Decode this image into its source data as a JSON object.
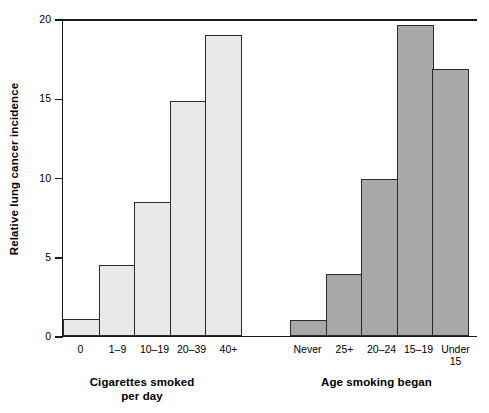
{
  "chart_data": {
    "type": "bar",
    "title": "",
    "xlabel": "",
    "ylabel": "Relative lung cancer incidence",
    "ylim": [
      0,
      20
    ],
    "yticks": [
      0,
      5,
      10,
      15,
      20
    ],
    "ytick_labels": [
      "0",
      "5",
      "10",
      "15",
      "20"
    ],
    "grid": false,
    "legend": "none",
    "groups": [
      {
        "name": "Cigarettes smoked per day",
        "title_lines": [
          "Cigarettes smoked",
          "per day"
        ],
        "color": "#e9e9e9",
        "categories": [
          "0",
          "1–9",
          "10–19",
          "20–39",
          "40+"
        ],
        "values": [
          1.1,
          4.5,
          8.45,
          14.8,
          19.0
        ]
      },
      {
        "name": "Age smoking began",
        "title_lines": [
          "Age smoking began"
        ],
        "color": "#a9a9a9",
        "categories": [
          "Never",
          "25+",
          "20–24",
          "15–19",
          "Under 15"
        ],
        "category_lines": [
          [
            "Never"
          ],
          [
            "25+"
          ],
          [
            "20–24"
          ],
          [
            "15–19"
          ],
          [
            "Under",
            "15"
          ]
        ],
        "values": [
          1.0,
          3.9,
          9.9,
          19.6,
          16.85
        ]
      }
    ]
  },
  "axis": {
    "y_title": "Relative lung cancer incidence",
    "ticks": [
      {
        "label": "20",
        "value": 20
      },
      {
        "label": "15",
        "value": 15
      },
      {
        "label": "10",
        "value": 10
      },
      {
        "label": "5",
        "value": 5
      },
      {
        "label": "0",
        "value": 0
      }
    ]
  },
  "groups": {
    "cigarettes": {
      "title_line1": "Cigarettes smoked",
      "title_line2": "per day",
      "cat0": "0",
      "cat1": "1–9",
      "cat2": "10–19",
      "cat3": "20–39",
      "cat4": "40+"
    },
    "age": {
      "title_line1": "Age smoking began",
      "cat0": "Never",
      "cat1": "25+",
      "cat2": "20–24",
      "cat3": "15–19",
      "cat4a": "Under",
      "cat4b": "15"
    }
  }
}
